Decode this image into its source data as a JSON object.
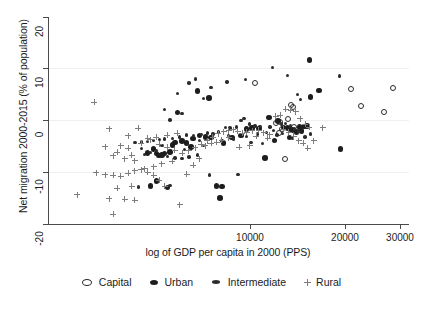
{
  "chart_data": {
    "type": "scatter",
    "title": "",
    "xlabel": "log of GDP per capita in 2000 (PPS)",
    "ylabel": "Net migration 2000-2015 (% of population)",
    "xscale": "log",
    "xlim": [
      2000,
      32000
    ],
    "ylim": [
      -21,
      21
    ],
    "xticks": [
      10000,
      20000,
      30000
    ],
    "xticklabels": [
      "10000",
      "20000",
      "30000"
    ],
    "yticks": [
      20,
      10,
      0,
      -10,
      -20
    ],
    "yticklabels": [
      "20",
      "10",
      "0",
      "-10",
      "-20"
    ],
    "grid": "horizontal-light",
    "legend_position": "below-axes",
    "legend": [
      {
        "name": "Capital",
        "marker": "open-circle"
      },
      {
        "name": "Urban",
        "marker": "filled-circle"
      },
      {
        "name": "Intermediate",
        "marker": "small-filled-dot"
      },
      {
        "name": "Rural",
        "marker": "plus"
      }
    ],
    "series": [
      {
        "name": "Capital",
        "marker": "open-circle",
        "color": "#2a2a2a",
        "points": [
          [
            9800,
            7.6
          ],
          [
            12900,
            3.2
          ],
          [
            12300,
            -7.7
          ],
          [
            11900,
            -0.1
          ],
          [
            11500,
            -0.5
          ],
          [
            12100,
            -1.6
          ],
          [
            20500,
            6.5
          ],
          [
            28200,
            6.6
          ],
          [
            22100,
            3.1
          ],
          [
            26500,
            1.8
          ],
          [
            13100,
            2.9
          ],
          [
            12600,
            0.4
          ],
          [
            11800,
            -2.4
          ],
          [
            13200,
            -1.3
          ]
        ]
      },
      {
        "name": "Urban",
        "marker": "filled-circle",
        "color": "#1d1d1d",
        "points": [
          [
            14900,
            12.3
          ],
          [
            16000,
            6.2
          ],
          [
            15000,
            4.8
          ],
          [
            6900,
            4.7
          ],
          [
            6300,
            6.0
          ],
          [
            5400,
            1.7
          ],
          [
            18900,
            -5.6
          ],
          [
            10600,
            -7.5
          ],
          [
            4400,
            -13.1
          ],
          [
            4600,
            -12.1
          ],
          [
            5000,
            -13.4
          ],
          [
            7300,
            -13.1
          ],
          [
            7600,
            -13.2
          ],
          [
            7500,
            -15.6
          ],
          [
            10900,
            0.7
          ],
          [
            11700,
            0.0
          ],
          [
            12200,
            -1.3
          ],
          [
            12600,
            -1.4
          ],
          [
            13800,
            -1.2
          ],
          [
            14300,
            -1.1
          ],
          [
            14600,
            -1.0
          ],
          [
            11400,
            -3.9
          ],
          [
            8800,
            -2.9
          ],
          [
            8200,
            -3.3
          ],
          [
            7000,
            -3.3
          ],
          [
            6700,
            -3.2
          ],
          [
            5800,
            -4.4
          ],
          [
            5300,
            -4.3
          ],
          [
            5100,
            -6.3
          ],
          [
            4900,
            -6.6
          ],
          [
            4800,
            -6.9
          ],
          [
            4700,
            -7.0
          ],
          [
            4600,
            -6.6
          ],
          [
            4500,
            -5.7
          ],
          [
            5600,
            -4.0
          ],
          [
            6100,
            -3.5
          ],
          [
            6400,
            -2.9
          ],
          [
            7700,
            -4.5
          ],
          [
            9200,
            -1.6
          ],
          [
            9600,
            -1.4
          ],
          [
            10100,
            -1.5
          ],
          [
            13000,
            -1.8
          ],
          [
            13500,
            -2.2
          ],
          [
            6000,
            -5.2
          ],
          [
            5200,
            -4.8
          ],
          [
            4300,
            -6.5
          ],
          [
            12800,
            -3.3
          ],
          [
            14000,
            -2.0
          ]
        ]
      },
      {
        "name": "Intermediate",
        "marker": "small-filled-dot",
        "color": "#2b2b2b",
        "points": [
          [
            11200,
            10.8
          ],
          [
            12600,
            9.2
          ],
          [
            6200,
            8.5
          ],
          [
            7900,
            7.9
          ],
          [
            18800,
            9.1
          ],
          [
            5900,
            7.7
          ],
          [
            7000,
            6.8
          ],
          [
            13600,
            5.4
          ],
          [
            5400,
            5.6
          ],
          [
            13900,
            4.4
          ],
          [
            6600,
            4.6
          ],
          [
            4900,
            2.3
          ],
          [
            5600,
            1.5
          ],
          [
            9100,
            8.4
          ],
          [
            8800,
            0.1
          ],
          [
            5100,
            0.2
          ],
          [
            9000,
            0.5
          ],
          [
            9400,
            -0.6
          ],
          [
            9800,
            -1.0
          ],
          [
            10200,
            -1.1
          ],
          [
            8500,
            -1.2
          ],
          [
            8100,
            -1.4
          ],
          [
            7800,
            -1.3
          ],
          [
            12400,
            -0.5
          ],
          [
            12900,
            -1.0
          ],
          [
            13300,
            -1.6
          ],
          [
            13700,
            -2.0
          ],
          [
            11000,
            -1.2
          ],
          [
            10700,
            -2.3
          ],
          [
            7400,
            -2.2
          ],
          [
            7100,
            -2.6
          ],
          [
            6800,
            -2.4
          ],
          [
            6500,
            -2.7
          ],
          [
            6100,
            -2.9
          ],
          [
            5800,
            -2.8
          ],
          [
            5500,
            -3.2
          ],
          [
            5200,
            -3.5
          ],
          [
            4900,
            -3.6
          ],
          [
            4700,
            -3.7
          ],
          [
            4500,
            -3.9
          ],
          [
            4300,
            -4.1
          ],
          [
            4100,
            -4.2
          ],
          [
            3900,
            -4.4
          ],
          [
            5000,
            -7.2
          ],
          [
            5300,
            -7.5
          ],
          [
            5600,
            -7.6
          ],
          [
            5900,
            -7.3
          ],
          [
            4600,
            -6.0
          ],
          [
            4400,
            -6.3
          ],
          [
            4200,
            -6.8
          ],
          [
            6300,
            -6.9
          ],
          [
            8600,
            -10.8
          ],
          [
            6900,
            -10.9
          ],
          [
            11600,
            -2.8
          ],
          [
            12100,
            -2.5
          ],
          [
            13100,
            -3.4
          ],
          [
            14400,
            -3.2
          ],
          [
            15000,
            -2.6
          ],
          [
            10400,
            -4.5
          ],
          [
            9500,
            -4.3
          ],
          [
            8300,
            -3.6
          ],
          [
            7600,
            -4.0
          ],
          [
            6600,
            -5.0
          ],
          [
            5100,
            -13.0
          ],
          [
            4000,
            -13.3
          ],
          [
            12000,
            -0.6
          ],
          [
            11300,
            -1.9
          ],
          [
            10000,
            -2.6
          ],
          [
            9200,
            -3.1
          ],
          [
            8000,
            -2.9
          ],
          [
            6400,
            -3.9
          ],
          [
            5700,
            -5.8
          ],
          [
            4800,
            -5.0
          ],
          [
            4100,
            -5.6
          ]
        ]
      },
      {
        "name": "Rural",
        "marker": "plus",
        "color": "#7d7d7d",
        "points": [
          [
            2850,
            3.8
          ],
          [
            3200,
            -1.6
          ],
          [
            2500,
            -14.9
          ],
          [
            2900,
            -10.4
          ],
          [
            4000,
            -1.5
          ],
          [
            3700,
            -3.0
          ],
          [
            3500,
            -5.0
          ],
          [
            3400,
            -6.3
          ],
          [
            3300,
            -7.0
          ],
          [
            3600,
            -7.6
          ],
          [
            3900,
            -8.0
          ],
          [
            3800,
            -6.9
          ],
          [
            3700,
            -5.5
          ],
          [
            4100,
            -4.5
          ],
          [
            4400,
            -3.8
          ],
          [
            4700,
            -4.7
          ],
          [
            5000,
            -5.3
          ],
          [
            5300,
            -5.9
          ],
          [
            5600,
            -6.5
          ],
          [
            5900,
            -6.0
          ],
          [
            6200,
            -5.4
          ],
          [
            6500,
            -4.7
          ],
          [
            6800,
            -4.0
          ],
          [
            7100,
            -3.3
          ],
          [
            7400,
            -2.6
          ],
          [
            7700,
            -2.2
          ],
          [
            8000,
            -2.0
          ],
          [
            8300,
            -1.8
          ],
          [
            8600,
            -2.1
          ],
          [
            8900,
            -2.5
          ],
          [
            9200,
            -2.3
          ],
          [
            9600,
            -2.0
          ],
          [
            10100,
            -1.9
          ],
          [
            10500,
            -2.4
          ],
          [
            11000,
            -2.8
          ],
          [
            11500,
            1.0
          ],
          [
            11900,
            1.2
          ],
          [
            12400,
            2.4
          ],
          [
            12900,
            2.2
          ],
          [
            13400,
            1.9
          ],
          [
            13900,
            0.5
          ],
          [
            14400,
            -0.7
          ],
          [
            14900,
            -1.3
          ],
          [
            15400,
            -4.0
          ],
          [
            16500,
            -1.4
          ],
          [
            3100,
            -10.9
          ],
          [
            3300,
            -11.0
          ],
          [
            3500,
            -11.2
          ],
          [
            3700,
            -10.5
          ],
          [
            3900,
            -10.0
          ],
          [
            4100,
            -9.8
          ],
          [
            4300,
            -10.3
          ],
          [
            4500,
            -11.0
          ],
          [
            4700,
            -12.0
          ],
          [
            3400,
            -13.6
          ],
          [
            3800,
            -13.2
          ],
          [
            4900,
            -13.2
          ],
          [
            3200,
            -15.7
          ],
          [
            3600,
            -15.8
          ],
          [
            3900,
            -16.0
          ],
          [
            3300,
            -18.8
          ],
          [
            5500,
            -16.9
          ],
          [
            5800,
            -10.8
          ],
          [
            6100,
            -8.9
          ],
          [
            6400,
            -7.6
          ],
          [
            5200,
            -8.1
          ],
          [
            4800,
            -8.6
          ],
          [
            4500,
            -9.2
          ],
          [
            4200,
            -9.6
          ],
          [
            6700,
            -5.0
          ],
          [
            7000,
            -4.5
          ],
          [
            7300,
            -4.3
          ],
          [
            7600,
            -3.9
          ],
          [
            8000,
            -3.4
          ],
          [
            9900,
            -3.1
          ],
          [
            10800,
            -3.5
          ],
          [
            12200,
            -1.7
          ],
          [
            12700,
            -2.3
          ],
          [
            13200,
            -3.1
          ],
          [
            13700,
            -4.0
          ],
          [
            14200,
            -4.5
          ],
          [
            14700,
            -5.5
          ],
          [
            9400,
            -5.0
          ],
          [
            8700,
            -5.3
          ],
          [
            5000,
            -2.9
          ],
          [
            5400,
            -2.5
          ],
          [
            4600,
            -3.3
          ],
          [
            4300,
            -3.5
          ],
          [
            3100,
            -5.2
          ]
        ]
      }
    ]
  }
}
